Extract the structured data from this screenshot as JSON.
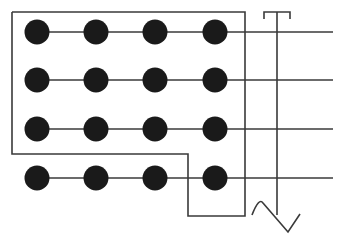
{
  "diagram": {
    "width": 347,
    "height": 245,
    "background": "#ffffff",
    "stroke_color": "#3a3a3a",
    "dot_color": "#1a1a1a",
    "dot_radius": 12.5,
    "rows_y": [
      32,
      80,
      129,
      178
    ],
    "cols_x": [
      37,
      96,
      155,
      215
    ],
    "line_end_x": 333,
    "enclosure": {
      "description": "Boundary enclosing top three rows fully and the right column of the bottom row",
      "points": [
        [
          12,
          12
        ],
        [
          245,
          12
        ],
        [
          245,
          216
        ],
        [
          188,
          216
        ],
        [
          188,
          154
        ],
        [
          12,
          154
        ]
      ]
    },
    "t_terminal": {
      "stem_x": 277,
      "top_y": 12,
      "bottom_y": 215,
      "bar_left_x": 264,
      "bar_right_x": 290,
      "tick_y": 19
    },
    "sine_wave": {
      "start": [
        252,
        215
      ],
      "peak": [
        263,
        203
      ],
      "trough": [
        288,
        232
      ],
      "end": [
        300,
        214
      ]
    }
  }
}
